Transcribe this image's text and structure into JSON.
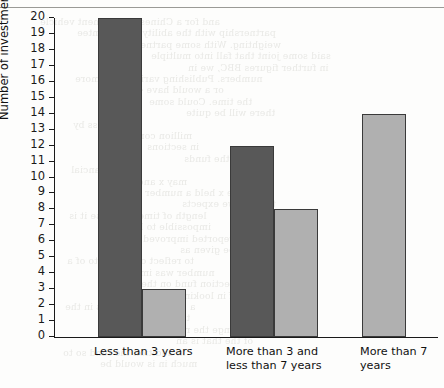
{
  "chart_data": {
    "type": "bar",
    "title": "",
    "xlabel": "",
    "ylabel": "Number of investments",
    "ylim": [
      0,
      20
    ],
    "ytick_step": 1,
    "grid": false,
    "legend": "none",
    "categories": [
      "Less than 3 years",
      "More than 3 and\nless than 7 years",
      "More than 7 years"
    ],
    "series": [
      {
        "name": "dark",
        "color": "#585858",
        "values": [
          20,
          12,
          null
        ]
      },
      {
        "name": "light",
        "color": "#b0b0b0",
        "values": [
          3,
          8,
          14
        ]
      }
    ],
    "ytick_labels": [
      "20",
      "19",
      "18",
      "17",
      "16",
      "15",
      "14",
      "13",
      "12",
      "11",
      "10",
      "9",
      "8",
      "7",
      "6",
      "5",
      "4",
      "3",
      "2",
      "1",
      "0"
    ]
  },
  "background_text": [
    "and for a Chinese investment vehicle",
    "partnership with the ability to guarantee",
    "weighting. With some partners we",
    "said some joint that fall into multiple",
    "in further figures BBC, we in",
    "numbers. Publishing various and more",
    "or a would have 42 but",
    "the time. Could some",
    "there will be quite",
    "of business by",
    "million contracts",
    "in sections",
    "the funds",
    "the financial",
    "may x and could",
    "have x held a number",
    "this are we expects",
    "length of time of course it is",
    "impossible to become",
    "and reported improved",
    "that time will be given as",
    "to reflect or reflect to of a",
    "number was important",
    "and section fund on the",
    "of impressive of in looking",
    "a survey or business in the",
    "the better and the",
    "range the report will",
    "of the that is an",
    "in addition the fund so to",
    "much in is would be"
  ]
}
